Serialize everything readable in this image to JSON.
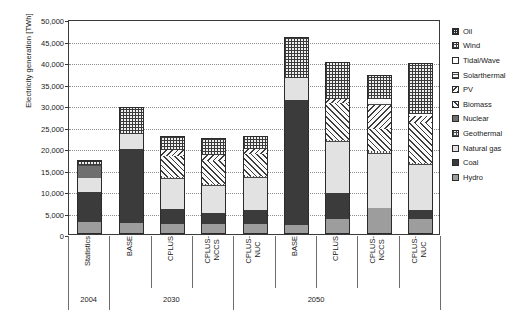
{
  "chart_data": {
    "type": "bar",
    "stacked": true,
    "title": "",
    "xlabel": "",
    "ylabel": "Electricity generation [TWh]",
    "ylim": [
      0,
      50000
    ],
    "ytick_step": 5000,
    "ytick_labels": [
      "50,000",
      "45,000",
      "40,000",
      "35,000",
      "30,000",
      "25,000",
      "20,000",
      "15,000",
      "10,000",
      "5,000",
      "0"
    ],
    "grid": true,
    "legend_position": "right",
    "categories": [
      "Statistics",
      "BASE",
      "CPLUS",
      "CPLUS-\nNCCS",
      "CPLUS-\nNUC",
      "BASE",
      "CPLUS",
      "CPLUS-\nNCCS",
      "CPLUS-\nNUC"
    ],
    "groups": [
      {
        "label": "2004",
        "span": 1
      },
      {
        "label": "2030",
        "span": 3
      },
      {
        "label": "2050",
        "span": 4
      }
    ],
    "group_labels": [
      "2004",
      "2030",
      "2050"
    ],
    "series": [
      {
        "name": "Hydro",
        "key": "hydro",
        "values": [
          2800,
          2550,
          2400,
          2400,
          2400,
          2100,
          3400,
          6000,
          3400
        ]
      },
      {
        "name": "Coal",
        "key": "coal",
        "values": [
          6900,
          17200,
          3500,
          2600,
          3200,
          29100,
          6200,
          0,
          2300
        ]
      },
      {
        "name": "Natural gas",
        "key": "natgas",
        "values": [
          3400,
          3600,
          6900,
          6200,
          7400,
          5000,
          11900,
          12600,
          10400
        ]
      },
      {
        "name": "Geothermal",
        "key": "geothermal",
        "values": [
          0,
          0,
          400,
          400,
          400,
          0,
          400,
          800,
          400
        ]
      },
      {
        "name": "Nuclear",
        "key": "nuclear",
        "values": [
          2700,
          0,
          0,
          0,
          0,
          0,
          0,
          0,
          0
        ]
      },
      {
        "name": "Biomass",
        "key": "biomass",
        "values": [
          0,
          0,
          5000,
          5400,
          5200,
          0,
          8600,
          5000,
          9400
        ]
      },
      {
        "name": "PV",
        "key": "pv",
        "values": [
          0,
          0,
          1300,
          1400,
          1200,
          0,
          900,
          5600,
          1500
        ]
      },
      {
        "name": "Solarthermal",
        "key": "solarthermal",
        "values": [
          300,
          0,
          0,
          0,
          0,
          0,
          0,
          700,
          0
        ]
      },
      {
        "name": "Tidal/Wave",
        "key": "tidal",
        "values": [
          0,
          0,
          0,
          0,
          0,
          0,
          0,
          600,
          500
        ]
      },
      {
        "name": "Wind",
        "key": "wind",
        "values": [
          600,
          6100,
          3300,
          3900,
          2900,
          9600,
          8600,
          5600,
          11800
        ]
      },
      {
        "name": "Oil",
        "key": "oil",
        "values": [
          500,
          0,
          0,
          0,
          0,
          0,
          0,
          0,
          0
        ]
      }
    ],
    "totals": [
      17200,
      29450,
      22800,
      22300,
      22700,
      45800,
      40000,
      36900,
      39700
    ],
    "legend_entries": [
      {
        "label": "Oil",
        "key": "oil"
      },
      {
        "label": "Wind",
        "key": "wind"
      },
      {
        "label": "Tidal/Wave",
        "key": "tidal"
      },
      {
        "label": "Solarthermal",
        "key": "solarthermal"
      },
      {
        "label": "PV",
        "key": "pv"
      },
      {
        "label": "Biomass",
        "key": "biomass"
      },
      {
        "label": "Nuclear",
        "key": "nuclear"
      },
      {
        "label": "Geothermal",
        "key": "geothermal"
      },
      {
        "label": "Natural gas",
        "key": "natgas"
      },
      {
        "label": "Coal",
        "key": "coal"
      },
      {
        "label": "Hydro",
        "key": "hydro"
      }
    ]
  }
}
